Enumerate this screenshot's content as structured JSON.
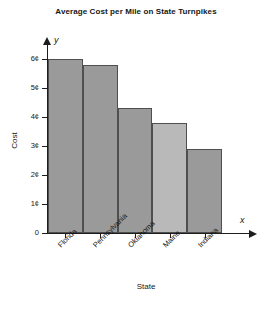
{
  "chart_data": {
    "type": "bar",
    "title": "Average Cost per Mile on State Turnpikes",
    "xlabel": "State",
    "ylabel": "Cost",
    "x_axis_variable": "x",
    "y_axis_variable": "y",
    "categories": [
      "Florida",
      "Pennsylvania",
      "Oklahoma",
      "Maine",
      "Indiana"
    ],
    "values": [
      6.0,
      5.8,
      4.3,
      3.8,
      2.9
    ],
    "value_unit": "¢",
    "ylim": [
      0,
      6.6
    ],
    "ytick_values": [
      0,
      1,
      2,
      3,
      4,
      5,
      6
    ],
    "ytick_labels": [
      "0",
      "1¢",
      "2¢",
      "3¢",
      "4¢",
      "5¢",
      "6¢"
    ],
    "grid": false,
    "legend": null,
    "bar_colors": [
      "#9a9a9a",
      "#9a9a9a",
      "#9a9a9a",
      "#b9b9b9",
      "#9a9a9a"
    ],
    "bar_edge_color": "#4f4f4f",
    "background_color": "#ffffff",
    "axis_color": "#1d1d1d",
    "text_color": "#161616"
  }
}
